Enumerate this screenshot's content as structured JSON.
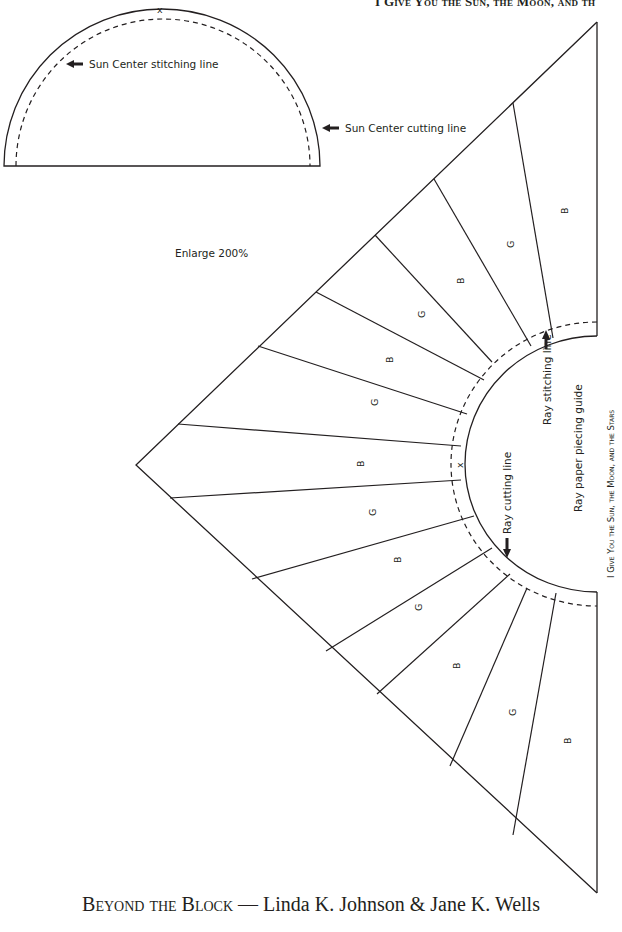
{
  "header": {
    "running_title": "I Give You the Sun, the Moon, and th"
  },
  "sun_center": {
    "stitching_label": "Sun Center stitching line",
    "cutting_label": "Sun Center cutting line",
    "mark": "x"
  },
  "instructions": {
    "enlarge": "Enlarge 200%"
  },
  "ray_guide": {
    "stitching_label": "Ray stitching line",
    "cutting_label": "Ray cutting line",
    "title": "Ray paper piecing guide",
    "center_mark": "x",
    "segments": [
      "B",
      "G",
      "B",
      "G",
      "B",
      "G",
      "B",
      "G",
      "B",
      "G",
      "B",
      "G",
      "B"
    ]
  },
  "side_caption": "I Give You the Sun, the Moon, and the Stars",
  "footer": {
    "book_title": "Beyond the Block",
    "separator": " — ",
    "authors": "Linda K. Johnson & Jane K. Wells"
  }
}
